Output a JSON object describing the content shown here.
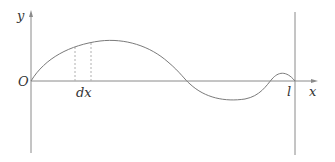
{
  "diagram": {
    "labels": {
      "y_axis": "y",
      "x_axis": "x",
      "origin": "O",
      "dx": "dx",
      "l": "l"
    },
    "colors": {
      "axis": "#8a8a8a",
      "curve": "#7a7a7a",
      "dashed": "#b0b0b0",
      "text": "#333333"
    }
  }
}
